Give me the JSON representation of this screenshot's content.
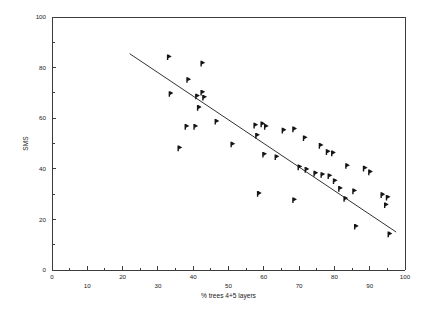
{
  "chart_data": {
    "type": "scatter",
    "title": "",
    "xlabel": "% trees 4+5 layers",
    "ylabel": "SMS",
    "xlim": [
      0,
      100
    ],
    "ylim": [
      0,
      100
    ],
    "grid": false,
    "legend": null,
    "x_ticks_labeled": [
      0,
      10,
      20,
      30,
      40,
      50,
      60,
      70,
      80,
      90,
      100
    ],
    "x_ticks_minor": [
      5,
      15,
      25,
      35,
      45,
      55,
      65,
      75,
      85,
      95
    ],
    "y_ticks_labeled": [
      0,
      20,
      40,
      60,
      80,
      100
    ],
    "y_ticks_minor": [
      10,
      30,
      50,
      70,
      90
    ],
    "x_tick_labels": [
      "0",
      "10",
      "20",
      "30",
      "40",
      "50",
      "60",
      "70",
      "80",
      "90",
      "100"
    ],
    "y_tick_labels": [
      "0",
      "20",
      "40",
      "60",
      "80",
      "100"
    ],
    "marker_style": "right-pointing-flag",
    "marker_color": "#141414",
    "points": [
      {
        "x": 33.0,
        "y": 84.0
      },
      {
        "x": 42.5,
        "y": 81.5
      },
      {
        "x": 38.5,
        "y": 75.0
      },
      {
        "x": 33.5,
        "y": 69.5
      },
      {
        "x": 41.0,
        "y": 68.5
      },
      {
        "x": 42.5,
        "y": 70.0
      },
      {
        "x": 43.0,
        "y": 68.0
      },
      {
        "x": 41.5,
        "y": 64.0
      },
      {
        "x": 46.5,
        "y": 58.5
      },
      {
        "x": 38.0,
        "y": 56.5
      },
      {
        "x": 40.5,
        "y": 56.5
      },
      {
        "x": 36.0,
        "y": 48.0
      },
      {
        "x": 57.5,
        "y": 57.0
      },
      {
        "x": 59.5,
        "y": 57.5
      },
      {
        "x": 60.5,
        "y": 56.5
      },
      {
        "x": 58.0,
        "y": 53.0
      },
      {
        "x": 65.5,
        "y": 55.0
      },
      {
        "x": 68.5,
        "y": 55.5
      },
      {
        "x": 71.5,
        "y": 52.0
      },
      {
        "x": 76.0,
        "y": 49.0
      },
      {
        "x": 51.0,
        "y": 49.5
      },
      {
        "x": 60.0,
        "y": 45.5
      },
      {
        "x": 63.5,
        "y": 44.5
      },
      {
        "x": 78.0,
        "y": 46.5
      },
      {
        "x": 79.5,
        "y": 46.0
      },
      {
        "x": 70.0,
        "y": 40.5
      },
      {
        "x": 72.0,
        "y": 39.5
      },
      {
        "x": 74.5,
        "y": 38.0
      },
      {
        "x": 76.5,
        "y": 37.5
      },
      {
        "x": 78.5,
        "y": 37.0
      },
      {
        "x": 80.0,
        "y": 35.0
      },
      {
        "x": 83.5,
        "y": 41.0
      },
      {
        "x": 88.5,
        "y": 40.0
      },
      {
        "x": 90.0,
        "y": 38.5
      },
      {
        "x": 81.5,
        "y": 32.0
      },
      {
        "x": 85.5,
        "y": 31.0
      },
      {
        "x": 58.5,
        "y": 30.0
      },
      {
        "x": 68.5,
        "y": 27.5
      },
      {
        "x": 83.0,
        "y": 28.0
      },
      {
        "x": 93.5,
        "y": 29.5
      },
      {
        "x": 95.0,
        "y": 28.5
      },
      {
        "x": 94.5,
        "y": 25.5
      },
      {
        "x": 86.0,
        "y": 17.0
      },
      {
        "x": 95.5,
        "y": 14.0
      }
    ],
    "fit_line": {
      "x_start": 22.0,
      "y_start": 85.5,
      "x_end": 97.5,
      "y_end": 15.0,
      "description": "linear regression trend line (negative slope)"
    }
  }
}
